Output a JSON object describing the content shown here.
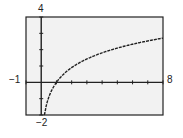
{
  "chart_data": {
    "type": "line",
    "title": "",
    "xlabel": "",
    "ylabel": "",
    "xlim": [
      -1,
      8
    ],
    "ylim": [
      -2,
      4
    ],
    "grid": false,
    "tick_labels": {
      "xmin": "−1",
      "xmax": "8",
      "ymin": "−2",
      "ymax": "4"
    },
    "x_ticks_step": 1,
    "y_ticks_step": 1,
    "series": [
      {
        "name": "y = 3 log x",
        "x": [
          0.2,
          0.3,
          0.5,
          0.75,
          1,
          1.5,
          2,
          3,
          4,
          5,
          6,
          7,
          8
        ],
        "values": [
          -2.1,
          -1.57,
          -0.9,
          -0.37,
          0,
          0.53,
          0.9,
          1.43,
          1.81,
          2.1,
          2.33,
          2.54,
          2.71
        ]
      }
    ],
    "colors": {
      "frame": "#222222",
      "background": "#f2f2f2",
      "curve": "#222222"
    }
  }
}
